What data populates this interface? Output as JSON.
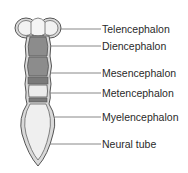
{
  "figure": {
    "colors": {
      "outline": "#555555",
      "wall_fill": "#d9d9d9",
      "dark_lumen": "#8c8c8c",
      "light_lumen": "#ececec",
      "leader_line": "#7a7a7a",
      "text": "#2a2a2a"
    }
  },
  "labels": [
    {
      "id": "telencephalon",
      "text": "Telencephalon",
      "y": 29
    },
    {
      "id": "diencephalon",
      "text": "Diencephalon",
      "y": 46
    },
    {
      "id": "mesencephalon",
      "text": "Mesencephalon",
      "y": 73
    },
    {
      "id": "metencephalon",
      "text": "Metencephalon",
      "y": 93
    },
    {
      "id": "myelencephalon",
      "text": "Myelencephalon",
      "y": 117
    },
    {
      "id": "neural-tube",
      "text": "Neural tube",
      "y": 144
    }
  ]
}
